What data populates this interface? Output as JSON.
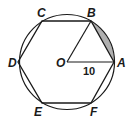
{
  "figure": {
    "type": "regular hexagon inscribed in circle",
    "center_label": "O",
    "radius_label": "10",
    "vertices": [
      "A",
      "B",
      "C",
      "D",
      "E",
      "F"
    ],
    "shaded_region": "segment between chord AB and arc AB",
    "colors": {
      "stroke": "#1a1a1a",
      "shade": "#b0b0b0",
      "background": "#ffffff"
    }
  },
  "labels": {
    "A": "A",
    "B": "B",
    "C": "C",
    "D": "D",
    "E": "E",
    "F": "F",
    "O": "O",
    "radius": "10"
  }
}
